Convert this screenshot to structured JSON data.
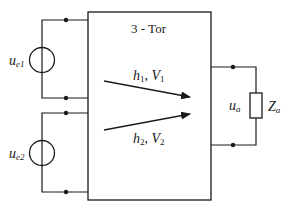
{
  "diagram": {
    "block_title": "3 - Tor",
    "sources": [
      {
        "label_main": "u",
        "label_sub": "e1"
      },
      {
        "label_main": "u",
        "label_sub": "e2"
      }
    ],
    "paths": [
      {
        "h_main": "h",
        "h_sub": "1",
        "v_main": "V",
        "v_sub": "1",
        "separator": ", "
      },
      {
        "h_main": "h",
        "h_sub": "2",
        "v_main": "V",
        "v_sub": "2",
        "separator": ", "
      }
    ],
    "output": {
      "voltage_main": "u",
      "voltage_sub": "a",
      "impedance_main": "Z",
      "impedance_sub": "a"
    },
    "colors": {
      "line": "#1a1a1a",
      "background": "#ffffff"
    }
  }
}
